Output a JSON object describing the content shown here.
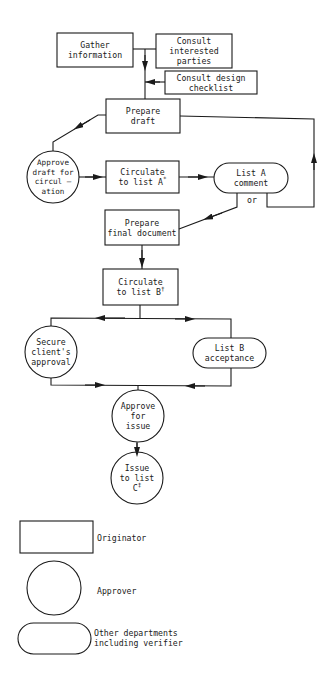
{
  "diagram": {
    "type": "flowchart",
    "nodes": {
      "gather": {
        "label": "Gather\ninformation",
        "shape": "rectangle",
        "role": "Originator"
      },
      "consult_parties": {
        "label": "Consult\ninterested\nparties",
        "shape": "rectangle",
        "role": "Originator"
      },
      "consult_checklist": {
        "label": "Consult design\nchecklist",
        "shape": "rectangle",
        "role": "Originator"
      },
      "prepare_draft": {
        "label": "Prepare\ndraft",
        "shape": "rectangle",
        "role": "Originator"
      },
      "approve_draft": {
        "label": "Approve\ndraft for\ncircul —\nation",
        "shape": "circle",
        "role": "Approver"
      },
      "circulate_a": {
        "label": "Circulate\nto list A",
        "mark": "*",
        "shape": "rectangle",
        "role": "Originator"
      },
      "list_a_comment": {
        "label": "List A\ncomment",
        "shape": "pill",
        "role": "Other departments including verifier"
      },
      "or_label": {
        "label": "or"
      },
      "prepare_final": {
        "label": "Prepare\nfinal document",
        "shape": "rectangle",
        "role": "Originator"
      },
      "circulate_b": {
        "label": "Circulate\nto list B",
        "mark": "†",
        "shape": "rectangle",
        "role": "Originator"
      },
      "secure_approval": {
        "label": "Secure\nclient's\napproval",
        "shape": "circle",
        "role": "Approver"
      },
      "list_b_acceptance": {
        "label": "List B\nacceptance",
        "shape": "pill",
        "role": "Other departments including verifier"
      },
      "approve_issue": {
        "label": "Approve\nfor\nissue",
        "shape": "circle",
        "role": "Approver"
      },
      "issue_list_c": {
        "label": "Issue\nto list\nC",
        "mark": "‡",
        "shape": "circle",
        "role": "Approver"
      }
    },
    "edges": [
      {
        "from": "gather",
        "to": "prepare_draft"
      },
      {
        "from": "consult_parties",
        "to": "prepare_draft"
      },
      {
        "from": "consult_checklist",
        "to": "prepare_draft"
      },
      {
        "from": "prepare_draft",
        "to": "approve_draft"
      },
      {
        "from": "approve_draft",
        "to": "circulate_a"
      },
      {
        "from": "circulate_a",
        "to": "list_a_comment"
      },
      {
        "from": "list_a_comment",
        "to": "prepare_final",
        "label": "or"
      },
      {
        "from": "list_a_comment",
        "to": "prepare_draft",
        "label": "or"
      },
      {
        "from": "prepare_final",
        "to": "circulate_b"
      },
      {
        "from": "circulate_b",
        "to": "secure_approval"
      },
      {
        "from": "circulate_b",
        "to": "list_b_acceptance"
      },
      {
        "from": "secure_approval",
        "to": "approve_issue"
      },
      {
        "from": "list_b_acceptance",
        "to": "approve_issue"
      },
      {
        "from": "approve_issue",
        "to": "issue_list_c"
      }
    ]
  },
  "legend": {
    "items": [
      {
        "shape": "rectangle",
        "label": "Originator"
      },
      {
        "shape": "circle",
        "label": "Approver"
      },
      {
        "shape": "pill",
        "label": "Other departments\nincluding verifier"
      }
    ]
  },
  "colors": {
    "stroke": "#1a1a1a",
    "background": "#ffffff"
  }
}
